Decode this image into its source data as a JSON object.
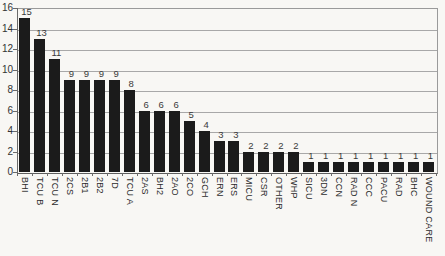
{
  "chart_data": {
    "type": "bar",
    "title": "",
    "xlabel": "",
    "ylabel": "",
    "categories": [
      "BHI",
      "TCU B",
      "TCU N",
      "2CS",
      "2B1",
      "2B2",
      "7D",
      "TCU A",
      "2AS",
      "BH2",
      "2AO",
      "2CO",
      "GCH",
      "ERN",
      "ERS",
      "MICU",
      "CSR",
      "OTHER",
      "WHP",
      "SICU",
      "3DN",
      "CCN",
      "RAD N",
      "CCC",
      "PACU",
      "RAD",
      "BHC",
      "WOUND CARE"
    ],
    "values": [
      15,
      13,
      11,
      9,
      9,
      9,
      9,
      8,
      6,
      6,
      6,
      5,
      4,
      3,
      3,
      2,
      2,
      2,
      2,
      1,
      1,
      1,
      1,
      1,
      1,
      1,
      1,
      1
    ],
    "value_labels": [
      "15",
      "13",
      "11",
      "9",
      "9",
      "9",
      "9",
      "8",
      "6",
      "6",
      "6",
      "5",
      "4",
      "3",
      "3",
      "2",
      "2",
      "2",
      "2",
      "1",
      "1",
      "1",
      "1",
      "1",
      "1",
      "1",
      "1",
      "1"
    ],
    "y_ticks": [
      0,
      2,
      4,
      6,
      8,
      10,
      12,
      14,
      16
    ],
    "ylim": [
      0,
      16
    ],
    "grid": "horizontal",
    "legend": "none",
    "colors": {
      "bar": "#1b1b1b",
      "gridline": "#a8a8a8",
      "axis": "#6a6a6a",
      "value_label": "#3a3a3a",
      "category_label": "#2b2b2b",
      "background": "#f8f7f4"
    }
  }
}
